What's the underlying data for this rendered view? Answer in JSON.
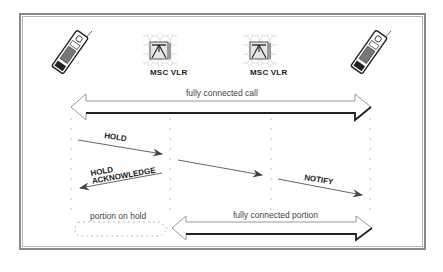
{
  "nodes": [
    {
      "id": "mobile-a",
      "type": "mobile-phone-icon"
    },
    {
      "id": "msc-vlr-1",
      "type": "msc-vlr-icon",
      "label": "MSC VLR"
    },
    {
      "id": "msc-vlr-2",
      "type": "msc-vlr-icon",
      "label": "MSC VLR"
    },
    {
      "id": "mobile-b",
      "type": "mobile-phone-icon"
    }
  ],
  "connections": {
    "top": {
      "label": "fully connected call",
      "direction": "bidirectional"
    },
    "bottom_left": {
      "label": "portion on hold",
      "style": "dashed"
    },
    "bottom_right": {
      "label": "fully connected portion",
      "direction": "bidirectional"
    }
  },
  "messages": [
    {
      "label": "HOLD",
      "from": "mobile-a",
      "to": "msc-vlr-1"
    },
    {
      "label": "HOLD\nACKNOWLEDGE",
      "line1": "HOLD",
      "line2": "ACKNOWLEDGE",
      "from": "msc-vlr-1",
      "to": "mobile-a"
    },
    {
      "label": "",
      "from": "msc-vlr-1",
      "to": "msc-vlr-2"
    },
    {
      "label": "NOTIFY",
      "from": "msc-vlr-2",
      "to": "mobile-b"
    }
  ],
  "colors": {
    "frame": "#8a8a8a",
    "arrow_fill": "#ffffff",
    "arrow_stroke": "#333333",
    "message_arrow": "#555555",
    "lifeline": "#aaaaaa"
  }
}
